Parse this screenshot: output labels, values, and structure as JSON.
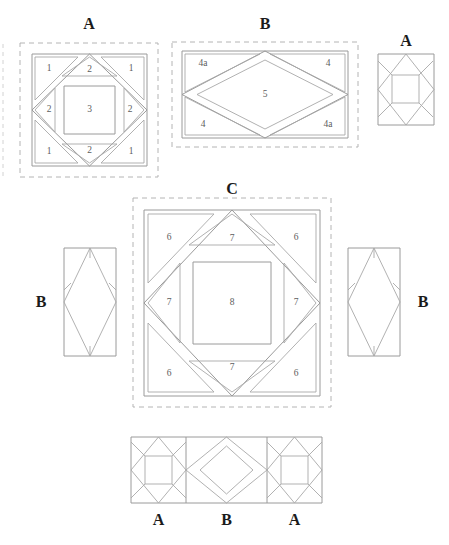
{
  "diagram": {
    "line_color": "#9a9a9a",
    "dash_color": "#b4b4b4",
    "label_color": "#1b1b1b",
    "number_color": "#5d5d5d",
    "background": "#ffffff"
  },
  "blocks": {
    "a_main": {
      "label": "A",
      "pieces": {
        "corner_tl": "1",
        "corner_tr": "1",
        "corner_bl": "1",
        "corner_br": "1",
        "edge_top": "2",
        "edge_right": "2",
        "edge_bottom": "2",
        "edge_left": "2",
        "center": "3"
      }
    },
    "b_main": {
      "label": "B",
      "pieces": {
        "corner_tl": "4a",
        "corner_tr": "4",
        "corner_bl": "4",
        "corner_br": "4a",
        "center": "5"
      }
    },
    "a_small": {
      "label": "A"
    },
    "c_main": {
      "label": "C",
      "pieces": {
        "corner_tl": "6",
        "corner_tr": "6",
        "corner_bl": "6",
        "corner_br": "6",
        "edge_top": "7",
        "edge_right": "7",
        "edge_bottom": "7",
        "edge_left": "7",
        "center": "8"
      }
    },
    "b_left": {
      "label": "B"
    },
    "b_right": {
      "label": "B"
    },
    "assembly_strip": {
      "labels": [
        "A",
        "B",
        "A"
      ]
    }
  }
}
